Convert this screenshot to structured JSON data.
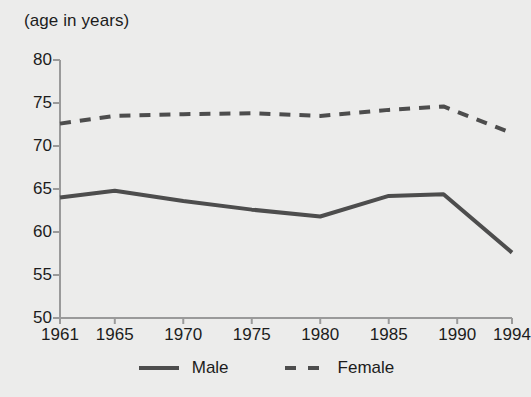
{
  "chart_data": {
    "type": "line",
    "title": "(age in years)",
    "xlabel": "",
    "ylabel": "(age in years)",
    "xlim": [
      1961,
      1994
    ],
    "ylim": [
      50,
      80
    ],
    "grid": false,
    "legend_position": "bottom-center",
    "x_tick_labels": [
      "1961",
      "1965",
      "1970",
      "1975",
      "1980",
      "1985",
      "1990",
      "1994"
    ],
    "x_ticks": [
      1961,
      1965,
      1970,
      1975,
      1980,
      1985,
      1990,
      1994
    ],
    "y_tick_labels": [
      "50",
      "55",
      "60",
      "65",
      "70",
      "75",
      "80"
    ],
    "y_ticks": [
      50,
      55,
      60,
      65,
      70,
      75,
      80
    ],
    "series": [
      {
        "name": "Male",
        "style": "solid",
        "color": "#4d4d4d",
        "x": [
          1961,
          1965,
          1970,
          1975,
          1980,
          1985,
          1989,
          1994
        ],
        "values": [
          64.0,
          64.8,
          63.6,
          62.6,
          61.8,
          64.2,
          64.4,
          57.6
        ]
      },
      {
        "name": "Female",
        "style": "dashed",
        "color": "#4d4d4d",
        "x": [
          1961,
          1965,
          1970,
          1975,
          1980,
          1985,
          1989,
          1994
        ],
        "values": [
          72.6,
          73.5,
          73.7,
          73.8,
          73.5,
          74.2,
          74.6,
          71.5
        ]
      }
    ]
  },
  "legend": {
    "items": [
      {
        "label": "Male",
        "style": "solid"
      },
      {
        "label": "Female",
        "style": "dashed"
      }
    ]
  },
  "colors": {
    "background": "#ececeb",
    "ink": "#1c1c1c",
    "line": "#4d4d4d",
    "axis": "#9a9a9a"
  }
}
